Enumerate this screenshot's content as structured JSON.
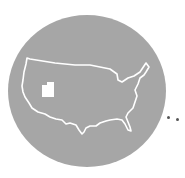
{
  "illustration": {
    "subject": "United States map with Utah highlighted",
    "highlighted_state": "Utah",
    "colors": {
      "circle": "#a6a6a6",
      "outline": "#ffffff",
      "highlight": "#ffffff",
      "dots": "#555555"
    },
    "trailing_dots": 2
  }
}
